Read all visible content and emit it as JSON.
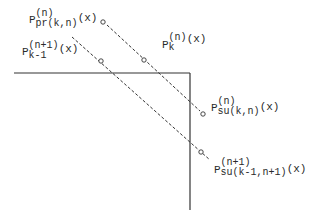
{
  "diagram": {
    "type": "geometric-construction",
    "labels": {
      "p_pr": {
        "base": "P",
        "sup": "(n)",
        "sub": "pr(k,n)",
        "arg": "(x)"
      },
      "p_km1": {
        "base": "P",
        "sup": "(n+1)",
        "sub": "k-1",
        "arg": "(x)"
      },
      "p_k": {
        "base": "P",
        "sup": "(n)",
        "sub": "k",
        "arg": "(x)"
      },
      "p_su": {
        "base": "P",
        "sup": "(n)",
        "sub": "su(k,n)",
        "arg": "(x)"
      },
      "p_su1": {
        "base": "P",
        "sup": "(n+1)",
        "sub": "su(k-1,n+1)",
        "arg": "(x)"
      }
    },
    "colors": {
      "line": "#333333",
      "text": "#2a2a2a",
      "background": "#ffffff"
    }
  }
}
